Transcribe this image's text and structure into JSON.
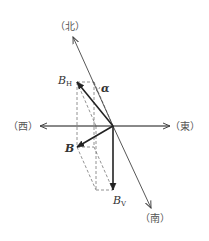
{
  "diagram": {
    "directions": {
      "north": "（北）",
      "south": "（南）",
      "west": "（西）",
      "east": "（東）"
    },
    "vectors": {
      "bh": {
        "symbol": "B",
        "subscript": "H"
      },
      "bv": {
        "symbol": "B",
        "subscript": "V"
      },
      "b": {
        "symbol": "B"
      }
    },
    "angle_label": "α",
    "colors": {
      "line": "#333333",
      "axis": "#555555",
      "dashed": "#777777"
    }
  }
}
